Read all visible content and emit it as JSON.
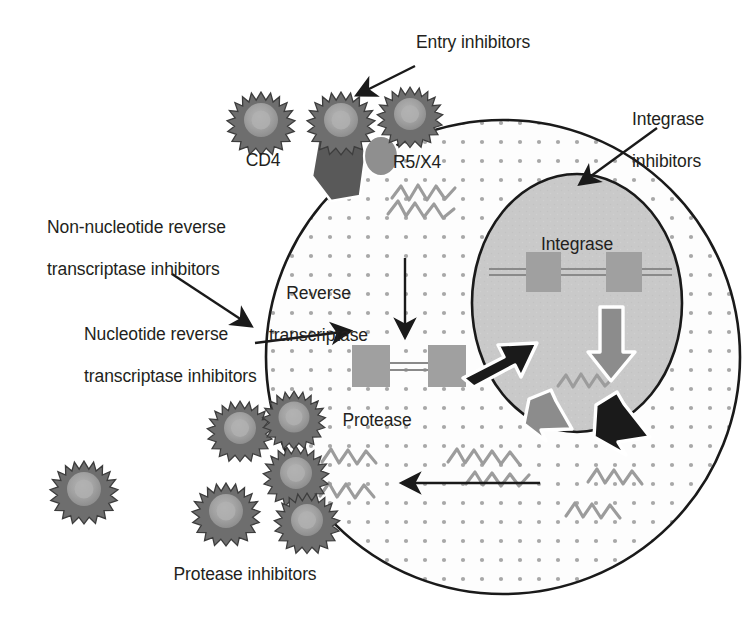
{
  "figure": {
    "width": 755,
    "height": 623,
    "background_color": "#ffffff",
    "ink_color": "#231f20"
  },
  "palette": {
    "text": "#231f20",
    "outline": "#1a1a1a",
    "cytoplasm_fill": "#fdfdfd",
    "cytoplasm_dot": "#a8a8a8",
    "nucleus_fill": "#c9c9c9",
    "nucleus_outline": "#1a1a1a",
    "virion_spike": "#6e6e6e",
    "virion_core": "#9a9a9a",
    "virion_center": "#b0b0b0",
    "cd4_receptor": "#595959",
    "coreceptor": "#8f8f8f",
    "provirus_block": "#a0a0a0",
    "dna_line": "#8a8a8a",
    "rna_squiggle": "#9c9c9c",
    "arrow_black": "#1a1a1a",
    "arrow_gray": "#8c8c8c",
    "arrow_outline_white": "#ffffff"
  },
  "labels": {
    "entry_inhibitors": "Entry inhibitors",
    "integrase_inhibitors_line1": "Integrase",
    "integrase_inhibitors_line2": "inhibitors",
    "cd4": "CD4",
    "coreceptor": "R5/X4",
    "nnrti_line1": "Non-nucleotide reverse",
    "nnrti_line2": "transcriptase inhibitors",
    "reverse_transcriptase_line1": "Reverse",
    "reverse_transcriptase_line2": "transcriptase",
    "nrti_line1": "Nucleotide reverse",
    "nrti_line2": "transcriptase inhibitors",
    "integrase": "Integrase",
    "protease": "Protease",
    "protease_inhibitors": "Protease inhibitors"
  },
  "structures": {
    "cell": {
      "name": "host-cell-cytoplasm",
      "cx": 503,
      "cy": 357,
      "r": 237,
      "fill": "#fdfdfd",
      "stroke": "#1a1a1a",
      "stroke_width": 2.6,
      "texture": "dotted"
    },
    "nucleus": {
      "name": "cell-nucleus",
      "cx": 577,
      "cy": 303,
      "rx": 105,
      "ry": 129,
      "fill": "#c9c9c9",
      "stroke": "#1a1a1a",
      "stroke_width": 2.6
    },
    "provirus_nuclear": {
      "name": "integrated-provirus-dna",
      "blocks": 2,
      "y": 272
    },
    "provirus_cytoplasmic": {
      "name": "reverse-transcribed-dna",
      "blocks": 2,
      "y": 366
    }
  },
  "virions": {
    "label": "hiv-virion",
    "spike_count": 18,
    "free_particles": [
      {
        "cx": 261,
        "cy": 120,
        "r": 28,
        "name": "virion-free-top-left"
      },
      {
        "cx": 341,
        "cy": 120,
        "r": 28,
        "name": "virion-bound-cd4"
      },
      {
        "cx": 410,
        "cy": 114,
        "r": 27,
        "name": "virion-bound-coreceptor"
      },
      {
        "cx": 240,
        "cy": 428,
        "r": 27,
        "name": "virion-budding-upper"
      },
      {
        "cx": 294,
        "cy": 417,
        "r": 26,
        "name": "virion-budding-right"
      },
      {
        "cx": 296,
        "cy": 473,
        "r": 27,
        "name": "virion-budding-mid"
      },
      {
        "cx": 84,
        "cy": 489,
        "r": 28,
        "name": "virion-released-far-left"
      },
      {
        "cx": 226,
        "cy": 511,
        "r": 28,
        "name": "virion-released-lower"
      },
      {
        "cx": 307,
        "cy": 520,
        "r": 27,
        "name": "virion-released-lower-right"
      }
    ]
  },
  "arrows": [
    {
      "name": "arrow-entry-inhibitors",
      "style": "thin-black",
      "from": [
        413,
        68
      ],
      "to": [
        355,
        96
      ]
    },
    {
      "name": "arrow-integrase-inhibitors",
      "style": "thin-black",
      "from": [
        655,
        130
      ],
      "to": [
        578,
        186
      ]
    },
    {
      "name": "arrow-nnrti",
      "style": "thin-black",
      "from": [
        175,
        276
      ],
      "to": [
        253,
        328
      ]
    },
    {
      "name": "arrow-nrti",
      "style": "thin-black",
      "from": [
        258,
        342
      ],
      "to": [
        352,
        330
      ]
    },
    {
      "name": "arrow-reverse-transcription",
      "style": "thin-black",
      "from": [
        405,
        262
      ],
      "to": [
        405,
        338
      ]
    },
    {
      "name": "arrow-dna-into-nucleus",
      "style": "block-black",
      "from": [
        466,
        360
      ],
      "to": [
        529,
        334
      ]
    },
    {
      "name": "arrow-transcription-in-nucleus",
      "style": "block-gray",
      "from": [
        611,
        312
      ],
      "to": [
        611,
        372
      ]
    },
    {
      "name": "arrow-rna-export-left",
      "style": "block-gray",
      "from": [
        536,
        403
      ],
      "to": [
        565,
        437
      ]
    },
    {
      "name": "arrow-rna-export-right",
      "style": "block-black",
      "from": [
        600,
        410
      ],
      "to": [
        645,
        450
      ]
    },
    {
      "name": "arrow-assembly-leftward",
      "style": "thin-black",
      "from": [
        538,
        483
      ],
      "to": [
        404,
        483
      ]
    }
  ],
  "rna_strands": [
    {
      "name": "rna-genomic-entering",
      "x": 398,
      "y": 196
    },
    {
      "name": "rna-nuclear-transcript",
      "x": 568,
      "y": 378
    },
    {
      "name": "rna-cytoplasm-center",
      "x": 468,
      "y": 460
    },
    {
      "name": "rna-cytoplasm-right",
      "x": 598,
      "y": 478
    },
    {
      "name": "rna-cytoplasm-lower-right",
      "x": 578,
      "y": 512
    },
    {
      "name": "rna-cytoplasm-left-upper",
      "x": 330,
      "y": 452
    },
    {
      "name": "rna-cytoplasm-left-lower",
      "x": 330,
      "y": 488
    }
  ]
}
